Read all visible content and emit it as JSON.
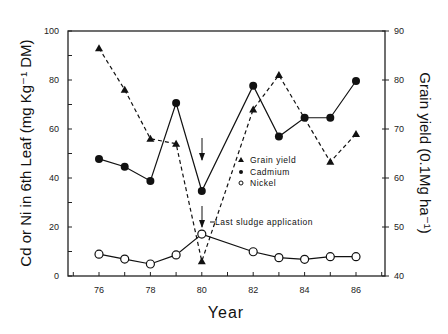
{
  "chart_data": {
    "type": "line",
    "title": "",
    "xlabel": "Year",
    "ylabel": "Cd or Ni in 6th Leaf (mg Kg⁻¹ DM)",
    "y2label": "Grain yield (0.1Mg ha⁻¹)",
    "xlim": [
      75,
      87.2
    ],
    "ylim": [
      0,
      100
    ],
    "y2lim": [
      40,
      90
    ],
    "xticks": [
      "76",
      "78",
      "80",
      "82",
      "84",
      "86"
    ],
    "yticks": [
      "0",
      "20",
      "40",
      "60",
      "80",
      "100"
    ],
    "y2ticks": [
      "40",
      "50",
      "60",
      "70",
      "80",
      "90"
    ],
    "x": [
      76,
      77,
      78,
      79,
      80,
      82,
      83,
      84,
      85,
      86
    ],
    "series": [
      {
        "name": "Grain yield",
        "axis": "right",
        "marker": "triangle",
        "line": "dashed",
        "values": [
          86.5,
          78,
          68,
          67,
          43,
          74,
          81,
          null,
          63.3,
          69
        ],
        "x": [
          76,
          77,
          78,
          79,
          80,
          82,
          83,
          84,
          85,
          86
        ]
      },
      {
        "name": "Cadmium",
        "axis": "left",
        "marker": "filled-circle",
        "line": "solid",
        "values": [
          47.8,
          44.6,
          38.8,
          70.6,
          34.7,
          77.7,
          56.9,
          64.6,
          64.6,
          79.6
        ]
      },
      {
        "name": "Nickel",
        "axis": "left",
        "marker": "open-circle",
        "line": "solid",
        "values": [
          8.9,
          6.9,
          4.9,
          8.6,
          17.1,
          9.9,
          7.5,
          6.8,
          7.9,
          7.9
        ]
      }
    ],
    "annotations": [
      {
        "text": "Last sludge application",
        "x": 80,
        "arrows": 2
      }
    ],
    "legend": {
      "position": "inside-center-right",
      "entries": [
        "Grain yield",
        "Cadmium",
        "Nickel"
      ]
    },
    "grid": false
  }
}
